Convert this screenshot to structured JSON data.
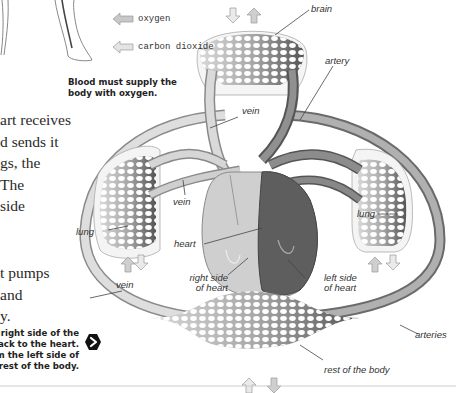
{
  "legend": {
    "items": [
      {
        "icon": "oxygen-arrow-icon",
        "label": "oxygen",
        "color": "#c8c8c8"
      },
      {
        "icon": "carbon-dioxide-arrow-icon",
        "label": "carbon dioxide",
        "color": "#e4e4e4"
      }
    ]
  },
  "captions": {
    "top": [
      "Blood must supply the",
      "body with oxygen."
    ],
    "bottom": [
      "right side of the",
      "ack to the heart.",
      "m the left side of",
      "rest of the body."
    ]
  },
  "body_text": {
    "upper": [
      "art receives",
      "d sends it",
      "gs, the",
      "The",
      "side"
    ],
    "lower": [
      "t pumps",
      "and",
      "y."
    ]
  },
  "next_button": {
    "icon": "next-arrow-icon",
    "glyph": "›"
  },
  "diagram_labels": {
    "brain": "brain",
    "artery": "artery",
    "vein_top": "vein",
    "vein_mid": "vein",
    "lung_left": "lung",
    "lung_right": "lung",
    "heart": "heart",
    "right_side_heart": [
      "right side",
      "of heart"
    ],
    "left_side_heart": [
      "left side",
      "of heart"
    ],
    "vein_bottom": "vein",
    "arteries": "arteries",
    "rest_of_body": "rest of the body"
  },
  "colors": {
    "vessel_light": "#d9d9d9",
    "vessel_dark": "#7a7a7a",
    "heart_right": "#c8c8c8",
    "heart_left": "#5e5e5e",
    "outline": "#9a9a9a"
  }
}
